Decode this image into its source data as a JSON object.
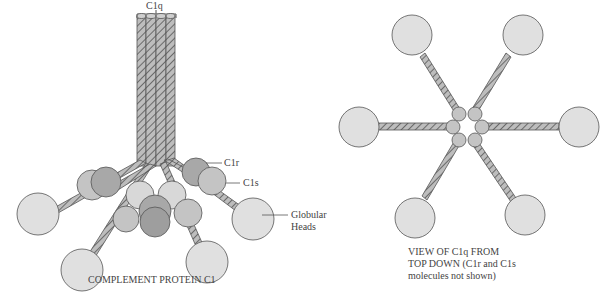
{
  "left_diagram": {
    "title": "COMPLEMENT PROTEIN C1",
    "labels": {
      "c1q": "C1q",
      "c1r": "C1r",
      "c1s": "C1s",
      "globular_heads_line1": "Globular",
      "globular_heads_line2": "Heads"
    }
  },
  "right_diagram": {
    "caption_line1": "VIEW OF C1q FROM",
    "caption_line2": "TOP DOWN (C1r and C1s",
    "caption_line3": "molecules not shown)"
  },
  "colors": {
    "head_fill": "#e0e0e0",
    "c1r_fill": "#a8a8a8",
    "c1s_fill": "#c4c4c4",
    "stroke": "#555555",
    "rope_fill": "#b8b8b8"
  }
}
